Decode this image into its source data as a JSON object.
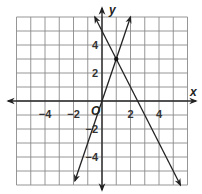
{
  "chart_data": {
    "type": "line",
    "title": "",
    "xlabel": "x",
    "ylabel": "y",
    "origin_label": "O",
    "xlim": [
      -6,
      6
    ],
    "ylim": [
      -6,
      6
    ],
    "grid": true,
    "grid_step": 1,
    "x_tick_labels": [
      {
        "value": -4,
        "text": "−4"
      },
      {
        "value": -2,
        "text": "−2"
      },
      {
        "value": 2,
        "text": "2"
      },
      {
        "value": 4,
        "text": "4"
      }
    ],
    "y_tick_labels": [
      {
        "value": 4,
        "text": "4"
      },
      {
        "value": 2,
        "text": "2"
      },
      {
        "value": -2,
        "text": "−2"
      },
      {
        "value": -4,
        "text": "−4"
      }
    ],
    "series": [
      {
        "name": "line-1",
        "equation": "y = 3x",
        "slope": 3,
        "intercept": 0,
        "x": [
          -1.9,
          2.0
        ],
        "y": [
          -5.7,
          6.0
        ],
        "arrows": "both"
      },
      {
        "name": "line-2",
        "equation": "y = -2x + 5",
        "slope": -2,
        "intercept": 5,
        "x": [
          -0.5,
          5.5
        ],
        "y": [
          6.0,
          -6.0
        ],
        "arrows": "both"
      }
    ],
    "intersection": {
      "x": 1,
      "y": 3
    },
    "legend": null
  }
}
